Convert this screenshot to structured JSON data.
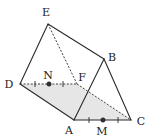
{
  "figure": {
    "type": "triangular-prism",
    "vertices": {
      "E": {
        "x": 48,
        "y": 24,
        "label": "E",
        "lx": 46,
        "ly": 16
      },
      "B": {
        "x": 104,
        "y": 59,
        "label": "B",
        "lx": 112,
        "ly": 61
      },
      "D": {
        "x": 20,
        "y": 84,
        "label": "D",
        "lx": 9,
        "ly": 88
      },
      "F": {
        "x": 77,
        "y": 84,
        "label": "F",
        "lx": 82,
        "ly": 81
      },
      "A": {
        "x": 74,
        "y": 120,
        "label": "A",
        "lx": 69,
        "ly": 134
      },
      "C": {
        "x": 131,
        "y": 120,
        "label": "C",
        "lx": 141,
        "ly": 125
      }
    },
    "points": {
      "N": {
        "x": 49,
        "y": 84,
        "label": "N",
        "lx": 48,
        "ly": 79
      },
      "M": {
        "x": 103,
        "y": 120,
        "label": "M",
        "lx": 102,
        "ly": 135
      }
    },
    "solid_edges": [
      [
        "E",
        "D"
      ],
      [
        "E",
        "B"
      ],
      [
        "D",
        "A"
      ],
      [
        "A",
        "B"
      ],
      [
        "B",
        "C"
      ],
      [
        "A",
        "C"
      ]
    ],
    "dashed_edges": [
      [
        "E",
        "F"
      ],
      [
        "D",
        "F"
      ],
      [
        "F",
        "C"
      ]
    ],
    "shaded_face": [
      "D",
      "F",
      "C",
      "A"
    ],
    "ticks": {
      "DF": [
        35,
        63
      ],
      "AC": [
        89,
        118
      ]
    },
    "colors": {
      "stroke": "#2b2b2b",
      "shade": "#e6e6e6",
      "point": "#333333"
    }
  }
}
